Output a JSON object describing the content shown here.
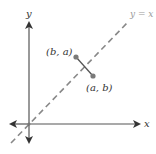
{
  "diagram": {
    "axes": {
      "x_label": "x",
      "y_label": "y"
    },
    "line": {
      "label": "y = x",
      "style": "dashed"
    },
    "points": [
      {
        "label": "(b, a)"
      },
      {
        "label": "(a, b)"
      }
    ],
    "colors": {
      "axis": "#555555",
      "dashed_line": "#888888",
      "point": "#7a7a7a",
      "segment": "#555555",
      "label": "#333333",
      "line_label": "#9a9a9a"
    }
  }
}
